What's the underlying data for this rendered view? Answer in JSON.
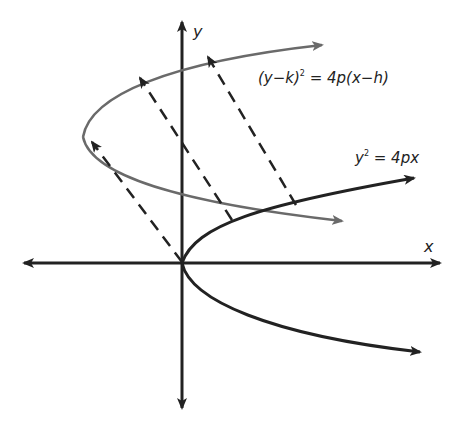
{
  "diagram": {
    "axes": {
      "x_label": "x",
      "y_label": "y"
    },
    "curves": [
      {
        "id": "original",
        "equation_label": "y² = 4px",
        "color": "#222222",
        "vertex": "origin"
      },
      {
        "id": "translated",
        "equation_label": "(y−k)² = 4p(x−h)",
        "color": "#666666",
        "vertex": "(h, k)"
      }
    ],
    "translation_arrows": {
      "count": 3,
      "style": "dashed",
      "direction": "from original curve to translated curve"
    },
    "labels": {
      "y_axis": "y",
      "x_axis": "x",
      "original_eq_lhs": "y",
      "original_eq_sup": "2",
      "original_eq_rhs": " = 4px",
      "translated_eq_lhs": "(y−k)",
      "translated_eq_sup": "2",
      "translated_eq_rhs": " = 4p(x−h)"
    },
    "colors": {
      "axis": "#222222",
      "original_curve": "#222222",
      "translated_curve": "#6a6a6a",
      "dashed": "#222222",
      "background": "#ffffff"
    }
  }
}
